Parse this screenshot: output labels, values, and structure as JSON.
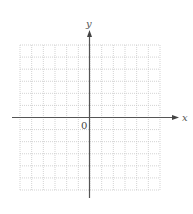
{
  "chart_data": {
    "type": "scatter",
    "title": "",
    "xlabel": "x",
    "ylabel": "y",
    "origin_label": "0",
    "grid": true,
    "grid_cells_x": 12,
    "grid_cells_y": 12,
    "xlim": [
      -6,
      6
    ],
    "ylim": [
      -6,
      6
    ],
    "series": [],
    "colors": {
      "axis": "#555555",
      "grid": "#c8c8c8",
      "text": "#555555"
    }
  },
  "labels": {
    "x_axis": "x",
    "y_axis": "y",
    "origin": "0"
  }
}
